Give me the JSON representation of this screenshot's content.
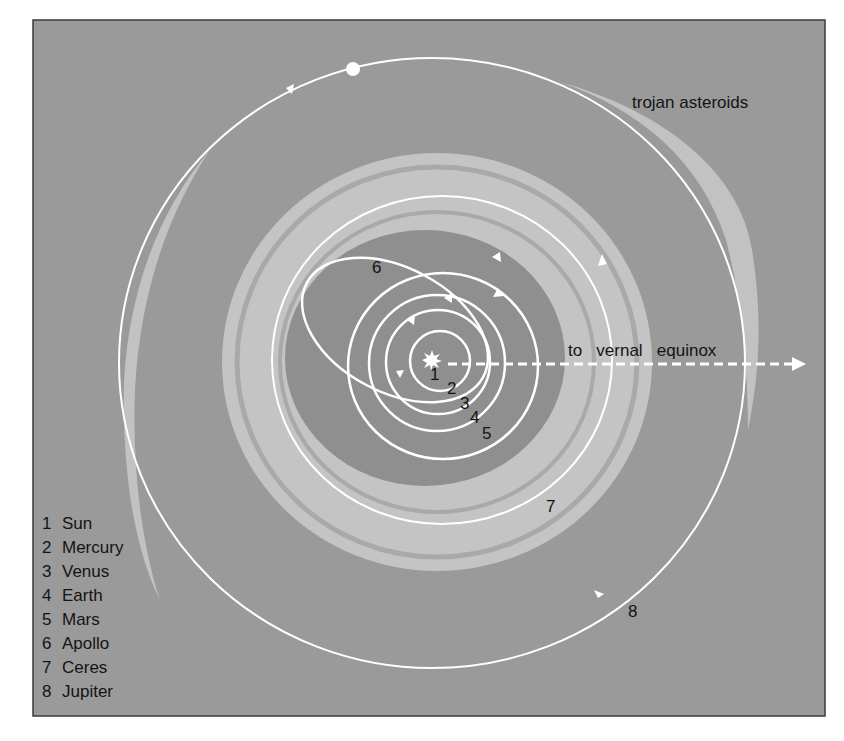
{
  "frame": {
    "x": 33,
    "y": 20,
    "width": 792,
    "height": 696,
    "background": "#9a9a9a",
    "border": "#3a3a3a"
  },
  "colors": {
    "background_gray": "#9a9a9a",
    "belt_light": "#c4c4c4",
    "belt_gap": "#a9a9a9",
    "inner_region": "#8f8f8f",
    "trojan_light": "#c2c2c2",
    "orbit_line": "#ffffff",
    "text": "#141414"
  },
  "sun": {
    "x": 432,
    "y": 360,
    "label": "1"
  },
  "orbits": [
    {
      "id": 2,
      "name": "Mercury",
      "cx": 440,
      "cy": 361,
      "rx": 30,
      "ry": 30,
      "label": "2",
      "label_x": 447,
      "label_y": 394
    },
    {
      "id": 3,
      "name": "Venus",
      "cx": 438,
      "cy": 362,
      "rx": 52,
      "ry": 52,
      "label": "3",
      "label_x": 460,
      "label_y": 409
    },
    {
      "id": 4,
      "name": "Earth",
      "cx": 437,
      "cy": 363,
      "rx": 68,
      "ry": 68,
      "label": "4",
      "label_x": 470,
      "label_y": 422
    },
    {
      "id": 5,
      "name": "Mars",
      "cx": 443,
      "cy": 366,
      "rx": 95,
      "ry": 93,
      "label": "5",
      "label_x": 482,
      "label_y": 438
    },
    {
      "id": 6,
      "name": "Apollo",
      "cx": 395,
      "cy": 330,
      "rx": 100,
      "ry": 62,
      "rotate": 28,
      "label": "6",
      "label_x": 372,
      "label_y": 273
    },
    {
      "id": 7,
      "name": "Ceres",
      "cx": 442,
      "cy": 360,
      "rx": 170,
      "ry": 164,
      "label": "7",
      "label_x": 546,
      "label_y": 512
    },
    {
      "id": 8,
      "name": "Jupiter",
      "cx": 432,
      "cy": 363,
      "rx": 313,
      "ry": 305,
      "label": "8",
      "label_x": 628,
      "label_y": 617
    }
  ],
  "asteroid_belt": {
    "cx": 437,
    "cy": 362,
    "outer_rx": 215,
    "outer_ry": 209,
    "inner_rx": 140,
    "inner_ry": 128,
    "gaps": [
      {
        "rx": 200,
        "ry": 195
      },
      {
        "rx": 157,
        "ry": 150
      }
    ]
  },
  "jupiter_planet": {
    "x": 353,
    "y": 69,
    "r": 7
  },
  "vernal_equinox": {
    "text": "to   vernal   equinox",
    "text_x": 568,
    "text_y": 356,
    "line_y": 364,
    "line_x1": 448,
    "line_x2": 792,
    "arrow_tip_x": 806
  },
  "trojan_asteroids": {
    "text": "trojan asteroids",
    "text_x": 632,
    "text_y": 108
  },
  "legend": {
    "x": 42,
    "y_start": 529,
    "line_height": 24,
    "items": [
      {
        "num": "1",
        "name": "Sun"
      },
      {
        "num": "2",
        "name": "Mercury"
      },
      {
        "num": "3",
        "name": "Venus"
      },
      {
        "num": "4",
        "name": "Earth"
      },
      {
        "num": "5",
        "name": "Mars"
      },
      {
        "num": "6",
        "name": "Apollo"
      },
      {
        "num": "7",
        "name": "Ceres"
      },
      {
        "num": "8",
        "name": "Jupiter"
      }
    ]
  }
}
